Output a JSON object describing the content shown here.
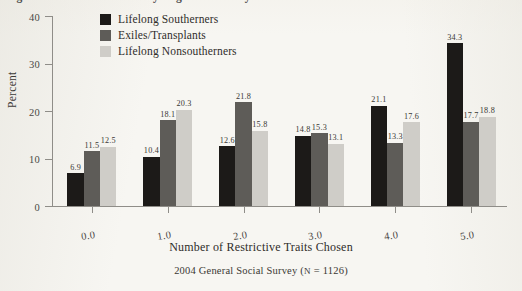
{
  "figure": {
    "title_partial": "Figure ... Restrictive Traits by Regional Identity",
    "background_color": "#f7f6f2"
  },
  "chart_data": {
    "type": "bar",
    "title": "",
    "xlabel": "Number of Restrictive Traits Chosen",
    "ylabel": "Percent",
    "source_note_prefix": "2004 General Social Survey (",
    "source_note_n_symbol": "N",
    "source_note_middle": " = 1126)",
    "source_note_full": "2004 General Social Survey (N = 1126)",
    "categories": [
      "0.0",
      "1.0",
      "2.0",
      "3.0",
      "4.0",
      "5.0"
    ],
    "ylim": [
      0,
      40
    ],
    "yticks": [
      "0",
      "10",
      "20",
      "30",
      "40"
    ],
    "ytick_values": [
      0,
      10,
      20,
      30,
      40
    ],
    "grid": false,
    "legend_position": "top-center",
    "series": [
      {
        "name": "Lifelong Southerners",
        "color": "#1c1a18",
        "values": [
          6.9,
          10.4,
          12.6,
          14.8,
          21.1,
          34.3
        ],
        "labels": [
          "6.9",
          "10.4",
          "12.6",
          "14.8",
          "21.1",
          "34.3"
        ]
      },
      {
        "name": "Exiles/Transplants",
        "color": "#5e5c58",
        "values": [
          11.5,
          18.1,
          21.8,
          15.3,
          13.3,
          17.7
        ],
        "labels": [
          "11.5",
          "18.1",
          "21.8",
          "15.3",
          "13.3",
          "17.7"
        ]
      },
      {
        "name": "Lifelong Nonsoutherners",
        "color": "#cfcdc8",
        "values": [
          12.5,
          20.3,
          15.8,
          13.1,
          17.6,
          18.8
        ],
        "labels": [
          "12.5",
          "20.3",
          "15.8",
          "13.1",
          "17.6",
          "18.8"
        ]
      }
    ]
  }
}
